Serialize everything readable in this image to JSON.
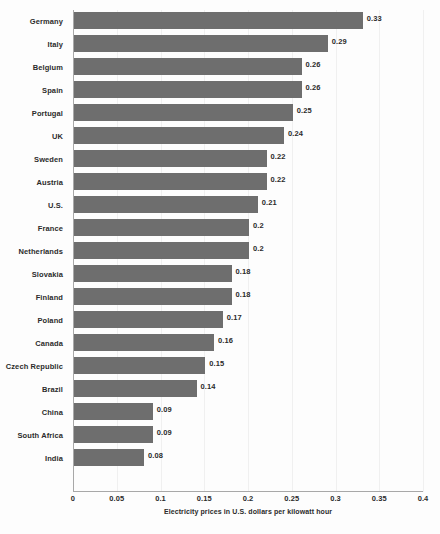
{
  "chart_data": {
    "type": "bar",
    "orientation": "horizontal",
    "title": "",
    "xlabel": "Electricity prices in U.S. dollars per kilowatt hour",
    "ylabel": "",
    "xlim": [
      0,
      0.4
    ],
    "xticks": [
      "0",
      "0.05",
      "0.1",
      "0.15",
      "0.2",
      "0.25",
      "0.3",
      "0.35",
      "0.4"
    ],
    "xtick_values": [
      0,
      0.05,
      0.1,
      0.15,
      0.2,
      0.25,
      0.3,
      0.35,
      0.4
    ],
    "grid": true,
    "legend": "none",
    "bar_color": "#6e6e6e",
    "background_color": "#fdfdfd",
    "categories": [
      "Germany",
      "Italy",
      "Belgium",
      "Spain",
      "Portugal",
      "UK",
      "Sweden",
      "Austria",
      "U.S.",
      "France",
      "Netherlands",
      "Slovakia",
      "Finland",
      "Poland",
      "Canada",
      "Czech Republic",
      "Brazil",
      "China",
      "South Africa",
      "India"
    ],
    "values": [
      0.33,
      0.29,
      0.26,
      0.26,
      0.25,
      0.24,
      0.22,
      0.22,
      0.21,
      0.2,
      0.2,
      0.18,
      0.18,
      0.17,
      0.16,
      0.15,
      0.14,
      0.09,
      0.09,
      0.08
    ],
    "value_labels": [
      "0.33",
      "0.29",
      "0.26",
      "0.26",
      "0.25",
      "0.24",
      "0.22",
      "0.22",
      "0.21",
      "0.2",
      "0.2",
      "0.18",
      "0.18",
      "0.17",
      "0.16",
      "0.15",
      "0.14",
      "0.09",
      "0.09",
      "0.08"
    ]
  }
}
